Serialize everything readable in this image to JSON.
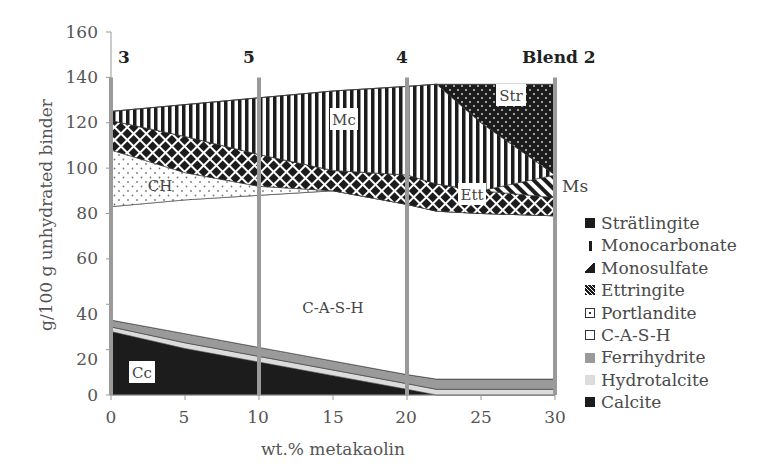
{
  "chart_data": {
    "type": "area",
    "stacked": true,
    "title": "",
    "xlabel": "wt.% metakaolin",
    "ylabel": "g/100 g unhydrated binder",
    "xlim": [
      0,
      30
    ],
    "ylim": [
      0,
      160
    ],
    "x_ticks": [
      0,
      5,
      10,
      15,
      20,
      25,
      30
    ],
    "y_ticks": [
      0,
      20,
      40,
      60,
      80,
      100,
      120,
      140,
      160
    ],
    "grid": false,
    "legend_position": "right",
    "x": [
      0,
      5,
      10,
      15,
      20,
      22,
      25,
      30
    ],
    "series": [
      {
        "name": "Calcite",
        "abbr": "Cc",
        "values": [
          28,
          20.5,
          14.5,
          8.5,
          2.5,
          0,
          0,
          0
        ]
      },
      {
        "name": "Hydrotalcite",
        "abbr": "",
        "values": [
          2,
          2.5,
          2.5,
          2.5,
          2.5,
          2.5,
          2.5,
          2.5
        ]
      },
      {
        "name": "Ferrihydrite",
        "abbr": "",
        "values": [
          3,
          4,
          4,
          4,
          4,
          4.5,
          4.5,
          4.5
        ]
      },
      {
        "name": "C-A-S-H",
        "abbr": "C-A-S-H",
        "values": [
          50,
          59,
          67,
          75,
          75,
          74,
          73,
          72
        ]
      },
      {
        "name": "Portlandite",
        "abbr": "CH",
        "values": [
          25,
          12,
          4,
          0,
          0,
          0,
          0,
          0
        ]
      },
      {
        "name": "Ettringite",
        "abbr": "Ett",
        "values": [
          13,
          16,
          14,
          9,
          13,
          12,
          10,
          8
        ]
      },
      {
        "name": "Monosulfate",
        "abbr": "Ms",
        "values": [
          0,
          0,
          0,
          0,
          0,
          0,
          0,
          10
        ]
      },
      {
        "name": "Monocarbonate",
        "abbr": "Mc",
        "values": [
          4,
          14,
          25,
          35,
          39,
          44,
          30,
          0
        ]
      },
      {
        "name": "Strätlingite",
        "abbr": "Str",
        "values": [
          0,
          0,
          0,
          0,
          0,
          0,
          17,
          40
        ]
      }
    ],
    "annotations": [
      {
        "text": "3",
        "x": 0,
        "type": "vertical-marker"
      },
      {
        "text": "5",
        "x": 10,
        "type": "vertical-marker"
      },
      {
        "text": "4",
        "x": 20,
        "type": "vertical-marker"
      },
      {
        "text": "Blend 2",
        "x": 30,
        "type": "vertical-marker"
      }
    ]
  },
  "axes": {
    "xlabel": "wt.% metakaolin",
    "ylabel": "g/100 g unhydrated binder",
    "x_ticks": [
      "0",
      "5",
      "10",
      "15",
      "20",
      "25",
      "30"
    ],
    "y_ticks": [
      "0",
      "20",
      "40",
      "60",
      "80",
      "100",
      "120",
      "140",
      "160"
    ]
  },
  "markers": {
    "m0": "3",
    "m10": "5",
    "m20": "4",
    "m30": "Blend 2"
  },
  "region_labels": {
    "cc": "Cc",
    "cash": "C-A-S-H",
    "ch": "CH",
    "mc": "Mc",
    "ett": "Ett",
    "str": "Str",
    "ms": "Ms"
  },
  "legend": [
    {
      "label": "Strätlingite"
    },
    {
      "label": "Monocarbonate"
    },
    {
      "label": "Monosulfate"
    },
    {
      "label": "Ettringite"
    },
    {
      "label": "Portlandite"
    },
    {
      "label": "C-A-S-H"
    },
    {
      "label": "Ferrihydrite"
    },
    {
      "label": "Hydrotalcite"
    },
    {
      "label": "Calcite"
    }
  ],
  "colors": {
    "calcite": "#1c1c1c",
    "hydrotalcite": "#dcdcdc",
    "ferrihydrite": "#9a9a9a",
    "cash": "#ffffff",
    "marker_line": "#9a9a9a",
    "axis": "#999999",
    "text": "#555555"
  }
}
